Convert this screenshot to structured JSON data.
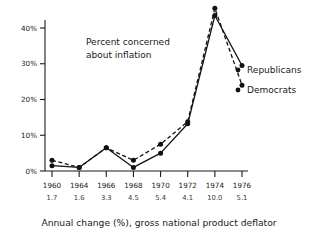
{
  "chart_data": {
    "type": "line",
    "title": "",
    "annotation": "Percent concerned\nabout inflation",
    "annotation_line1": "Percent concerned",
    "annotation_line2": "about inflation",
    "xlabel": "Annual change (%), gross national product deflator",
    "ylabel": "",
    "categories": [
      "1960",
      "1964",
      "1966",
      "1968",
      "1970",
      "1972",
      "1974",
      "1976"
    ],
    "secondary_tick_labels": [
      "1.7",
      "1.6",
      "3.3",
      "4.5",
      "5.4",
      "4.1",
      "10.0",
      "5.1"
    ],
    "ytick_labels": [
      "0%",
      "10%",
      "20%",
      "30%",
      "40%"
    ],
    "ytick_values": [
      0,
      10,
      20,
      30,
      40
    ],
    "ylim": [
      0,
      46
    ],
    "grid": false,
    "legend_position": "at-line-ends",
    "series": [
      {
        "name": "Democrats",
        "style": "dashed",
        "color": "#111111",
        "values": [
          3.0,
          1.0,
          6.5,
          3.0,
          7.5,
          13.8,
          45.5,
          24.0
        ]
      },
      {
        "name": "Republicans",
        "style": "solid",
        "color": "#111111",
        "values": [
          1.5,
          1.0,
          6.5,
          1.0,
          5.0,
          13.2,
          43.5,
          29.5
        ]
      }
    ]
  },
  "labels": {
    "republicans": "Republicans",
    "democrats": "Democrats"
  }
}
